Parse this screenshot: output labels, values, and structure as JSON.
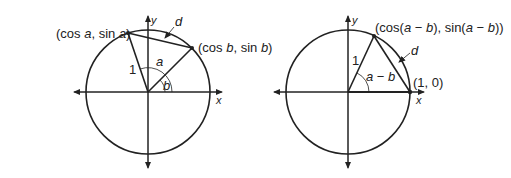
{
  "diagrams": [
    {
      "id": "left",
      "axis_x_label": "x",
      "axis_y_label": "y",
      "point_a_label_parts": [
        "(cos ",
        "a",
        ", sin ",
        "a",
        ")"
      ],
      "point_b_label_parts": [
        "(cos ",
        "b",
        ", sin ",
        "b",
        ")"
      ],
      "radius_label": "1",
      "angle_a_label": "a",
      "angle_b_label": "b",
      "chord_label": "d"
    },
    {
      "id": "right",
      "axis_x_label": "x",
      "axis_y_label": "y",
      "point_top_label_parts": [
        "(cos(",
        "a",
        " − ",
        "b",
        "), sin(",
        "a",
        " − ",
        "b",
        "))"
      ],
      "point_right_label": "(1, 0)",
      "radius_label": "1",
      "angle_label_parts": [
        "a",
        " − ",
        "b"
      ],
      "chord_label": "d"
    }
  ],
  "colors": {
    "stroke": "#222222",
    "background": "#ffffff"
  }
}
